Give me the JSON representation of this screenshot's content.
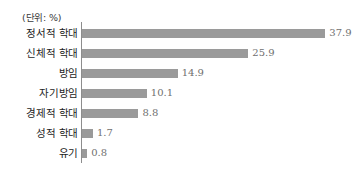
{
  "chart_data": {
    "type": "bar",
    "orientation": "horizontal",
    "title": "",
    "xlabel": "",
    "ylabel": "",
    "unit_note": "(단위: %)",
    "grid": false,
    "legend": null,
    "xlim": [
      0,
      38
    ],
    "categories": [
      "정서적 학대",
      "신체적 학대",
      "방임",
      "자기방임",
      "경제적 학대",
      "성적 학대",
      "유기"
    ],
    "values": [
      37.9,
      25.9,
      14.9,
      10.1,
      8.8,
      1.7,
      0.8
    ],
    "value_labels": [
      "37.9",
      "25.9",
      "14.9",
      "10.1",
      "8.8",
      "1.7",
      "0.8"
    ],
    "colors": {
      "bar": "#9a9a9a",
      "axis": "#8d8d8d",
      "category_text": "#1d1d1d",
      "value_text": "#6f6f6f",
      "background": "#ffffff"
    }
  }
}
